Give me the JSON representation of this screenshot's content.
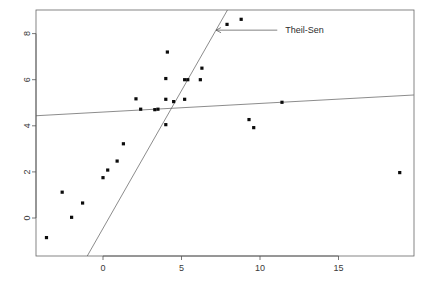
{
  "chart_data": {
    "type": "scatter",
    "title": "",
    "subtitle": "",
    "xlabel": "",
    "ylabel": "",
    "xlim": [
      -4.4,
      19.8
    ],
    "ylim": [
      -1.6,
      9.4
    ],
    "xticks": [
      0,
      5,
      10,
      15
    ],
    "yticks": [
      0,
      2,
      4,
      6,
      8
    ],
    "xtick_labels": [
      "0",
      "5",
      "10",
      "15"
    ],
    "ytick_labels": [
      "0",
      "2",
      "4",
      "6",
      "8"
    ],
    "grid": false,
    "legend_position": "none",
    "points": [
      {
        "x": -3.6,
        "y": -0.85
      },
      {
        "x": -2.6,
        "y": 1.12
      },
      {
        "x": -2.0,
        "y": 0.03
      },
      {
        "x": -1.3,
        "y": 0.65
      },
      {
        "x": 0.0,
        "y": 1.75
      },
      {
        "x": 0.3,
        "y": 2.08
      },
      {
        "x": 0.9,
        "y": 2.47
      },
      {
        "x": 1.3,
        "y": 3.22
      },
      {
        "x": 2.1,
        "y": 5.17
      },
      {
        "x": 2.4,
        "y": 4.72
      },
      {
        "x": 3.3,
        "y": 4.7
      },
      {
        "x": 3.5,
        "y": 4.72
      },
      {
        "x": 4.0,
        "y": 4.05
      },
      {
        "x": 4.0,
        "y": 6.05
      },
      {
        "x": 4.0,
        "y": 5.15
      },
      {
        "x": 4.1,
        "y": 7.2
      },
      {
        "x": 4.5,
        "y": 5.05
      },
      {
        "x": 5.2,
        "y": 5.15
      },
      {
        "x": 5.2,
        "y": 6.0
      },
      {
        "x": 5.4,
        "y": 6.0
      },
      {
        "x": 6.2,
        "y": 6.0
      },
      {
        "x": 6.3,
        "y": 6.5
      },
      {
        "x": 7.9,
        "y": 8.4
      },
      {
        "x": 8.8,
        "y": 8.62
      },
      {
        "x": 9.3,
        "y": 4.27
      },
      {
        "x": 9.6,
        "y": 3.92
      },
      {
        "x": 11.4,
        "y": 5.02
      },
      {
        "x": 18.9,
        "y": 1.97
      }
    ],
    "lines": [
      {
        "name": "theil-sen",
        "label": "Theil-Sen",
        "slope": 1.195,
        "intercept": -0.45,
        "x_start": -4.4,
        "x_end": 8.4,
        "color": "#5a5a5a"
      },
      {
        "name": "ols",
        "label": "",
        "slope": 0.0372,
        "intercept": 4.6,
        "x_start": -4.4,
        "x_end": 19.8,
        "color": "#5a5a5a"
      }
    ],
    "annotations": [
      {
        "name": "theil-sen-annotation",
        "text": "Theil-Sen",
        "arrow_from_x": 11.1,
        "arrow_from_y": 8.15,
        "arrow_to_x": 7.2,
        "arrow_to_y": 8.15
      }
    ]
  }
}
